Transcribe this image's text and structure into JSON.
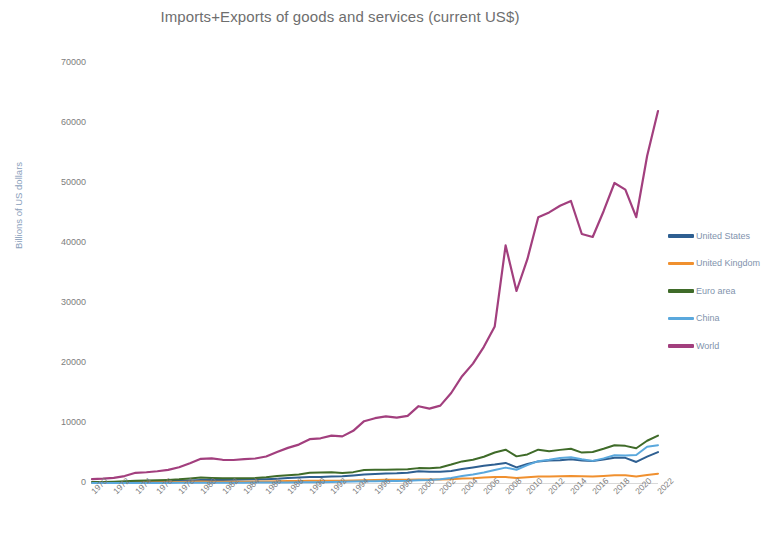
{
  "chart_data": {
    "type": "line",
    "title": "Imports+Exports of goods and services (current US$)",
    "xlabel": "",
    "ylabel": "Billions of US dollars",
    "ylim": [
      0,
      70000
    ],
    "xlim": [
      1970,
      2022
    ],
    "grid": false,
    "legend_position": "right",
    "ytick_labels": [
      "70000",
      "60000",
      "50000",
      "40000",
      "30000",
      "20000",
      "10000",
      "0"
    ],
    "ytick_values": [
      70000,
      60000,
      50000,
      40000,
      30000,
      20000,
      10000,
      0
    ],
    "xtick_labels": [
      "1970",
      "1972",
      "1974",
      "1976",
      "1978",
      "1980",
      "1982",
      "1984",
      "1986",
      "1988",
      "1990",
      "1992",
      "1994",
      "1996",
      "1998",
      "2000",
      "2002",
      "2004",
      "2006",
      "2008",
      "2010",
      "2012",
      "2014",
      "2016",
      "2018",
      "2020",
      "2022"
    ],
    "x": [
      1970,
      1971,
      1972,
      1973,
      1974,
      1975,
      1976,
      1977,
      1978,
      1979,
      1980,
      1981,
      1982,
      1983,
      1984,
      1985,
      1986,
      1987,
      1988,
      1989,
      1990,
      1991,
      1992,
      1993,
      1994,
      1995,
      1996,
      1997,
      1998,
      1999,
      2000,
      2001,
      2002,
      2003,
      2004,
      2005,
      2006,
      2007,
      2008,
      2009,
      2010,
      2011,
      2012,
      2013,
      2014,
      2015,
      2016,
      2017,
      2018,
      2019,
      2020,
      2021,
      2022
    ],
    "series": [
      {
        "name": "United States",
        "color": "#2e5f91",
        "values": [
          100,
          110,
          125,
          165,
          225,
          245,
          275,
          305,
          360,
          430,
          510,
          545,
          520,
          530,
          600,
          605,
          640,
          715,
          830,
          910,
          980,
          1010,
          1065,
          1110,
          1245,
          1400,
          1480,
          1600,
          1615,
          1710,
          1975,
          1870,
          1875,
          2010,
          2340,
          2590,
          2880,
          3070,
          3350,
          2600,
          3155,
          3600,
          3740,
          3810,
          3940,
          3760,
          3680,
          3900,
          4200,
          4190,
          3510,
          4400,
          5150
        ]
      },
      {
        "name": "United Kingdom",
        "color": "#f0902f",
        "values": [
          45,
          50,
          55,
          70,
          95,
          105,
          115,
          140,
          165,
          200,
          230,
          215,
          205,
          200,
          210,
          230,
          235,
          280,
          320,
          340,
          390,
          380,
          385,
          375,
          410,
          470,
          505,
          540,
          550,
          560,
          590,
          570,
          580,
          640,
          740,
          800,
          930,
          1010,
          1000,
          830,
          950,
          1080,
          1080,
          1110,
          1160,
          1120,
          1080,
          1180,
          1290,
          1310,
          1090,
          1320,
          1560
        ]
      },
      {
        "name": "Euro area",
        "color": "#3f6b29",
        "values": [
          155,
          175,
          215,
          290,
          380,
          410,
          445,
          510,
          610,
          760,
          900,
          830,
          800,
          780,
          790,
          830,
          960,
          1150,
          1300,
          1430,
          1720,
          1750,
          1810,
          1650,
          1810,
          2150,
          2200,
          2190,
          2270,
          2290,
          2480,
          2470,
          2590,
          3070,
          3600,
          3870,
          4380,
          5080,
          5550,
          4440,
          4760,
          5560,
          5290,
          5520,
          5710,
          5070,
          5160,
          5700,
          6290,
          6190,
          5790,
          7040,
          7900
        ]
      },
      {
        "name": "China",
        "color": "#5aa8dd",
        "values": [
          5,
          5,
          6,
          10,
          14,
          15,
          14,
          15,
          21,
          30,
          38,
          44,
          42,
          44,
          54,
          70,
          74,
          83,
          103,
          112,
          115,
          136,
          166,
          196,
          237,
          281,
          290,
          325,
          324,
          361,
          474,
          510,
          621,
          851,
          1155,
          1422,
          1761,
          2176,
          2563,
          2207,
          2974,
          3642,
          3867,
          4159,
          4301,
          3959,
          3686,
          4107,
          4623,
          4576,
          4655,
          6050,
          6310
        ]
      },
      {
        "name": "World",
        "color": "#a23f7e",
        "values": [
          650,
          720,
          860,
          1160,
          1700,
          1790,
          1960,
          2190,
          2620,
          3300,
          4030,
          4100,
          3870,
          3830,
          3990,
          4080,
          4420,
          5150,
          5850,
          6400,
          7300,
          7450,
          7900,
          7770,
          8700,
          10300,
          10800,
          11100,
          10900,
          11200,
          12800,
          12400,
          12900,
          15000,
          17800,
          19900,
          22700,
          26100,
          39600,
          32000,
          37300,
          44300,
          45100,
          46200,
          47000,
          41500,
          41000,
          45300,
          50000,
          48900,
          44300,
          54500,
          62000
        ]
      }
    ],
    "annotations": []
  },
  "legend": {
    "items": [
      {
        "label": "United States",
        "color": "#2e5f91"
      },
      {
        "label": "United Kingdom",
        "color": "#f0902f"
      },
      {
        "label": "Euro area",
        "color": "#3f6b29"
      },
      {
        "label": "China",
        "color": "#5aa8dd"
      },
      {
        "label": "World",
        "color": "#a23f7e"
      }
    ]
  }
}
